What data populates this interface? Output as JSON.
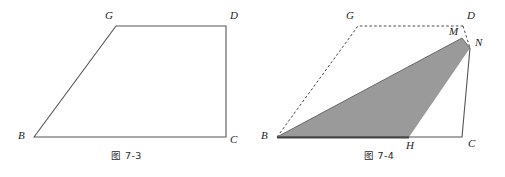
{
  "page": {
    "background_color": "#ffffff",
    "width": 505,
    "height": 177
  },
  "style": {
    "stroke_color": "#555555",
    "dash_color": "#4a4a4a",
    "fill_gray": "#9a9a9a",
    "label_color": "#1d1d1d"
  },
  "figures": [
    {
      "id": "figure-7-3",
      "caption": "图 7-3",
      "description": "trapezoid BGDC",
      "labels": {
        "G": "G",
        "D": "D",
        "B": "B",
        "C": "C"
      },
      "vertices": {
        "G": {
          "x": 116,
          "y": 26
        },
        "D": {
          "x": 226,
          "y": 26
        },
        "B": {
          "x": 34,
          "y": 137
        },
        "C": {
          "x": 226,
          "y": 137
        }
      },
      "label_positions": {
        "G": {
          "x": 105,
          "y": 10
        },
        "D": {
          "x": 230,
          "y": 10
        },
        "B": {
          "x": 18,
          "y": 130
        },
        "C": {
          "x": 230,
          "y": 134
        }
      },
      "edges": [
        {
          "from": "B",
          "to": "G",
          "style": "solid"
        },
        {
          "from": "G",
          "to": "D",
          "style": "solid"
        },
        {
          "from": "D",
          "to": "C",
          "style": "solid"
        },
        {
          "from": "C",
          "to": "B",
          "style": "solid"
        }
      ]
    },
    {
      "id": "figure-7-4",
      "caption": "图 7-4",
      "description": "trapezoid BGDC with shaded triangle B-M-H and point N",
      "labels": {
        "G": "G",
        "D": "D",
        "M": "M",
        "N": "N",
        "B": "B",
        "H": "H",
        "C": "C"
      },
      "vertices": {
        "G": {
          "x": 105,
          "y": 26
        },
        "D": {
          "x": 210,
          "y": 26
        },
        "M": {
          "x": 209,
          "y": 38
        },
        "N": {
          "x": 217,
          "y": 48
        },
        "B": {
          "x": 24,
          "y": 137
        },
        "H": {
          "x": 156,
          "y": 137
        },
        "C": {
          "x": 209,
          "y": 137
        }
      },
      "label_positions": {
        "G": {
          "x": 93,
          "y": 10
        },
        "D": {
          "x": 214,
          "y": 10
        },
        "M": {
          "x": 196,
          "y": 26
        },
        "N": {
          "x": 222,
          "y": 37
        },
        "B": {
          "x": 8,
          "y": 130
        },
        "H": {
          "x": 153,
          "y": 136
        },
        "C": {
          "x": 215,
          "y": 134
        }
      },
      "edges": [
        {
          "from": "B",
          "to": "G",
          "style": "dashed"
        },
        {
          "from": "G",
          "to": "D",
          "style": "dashed"
        },
        {
          "from": "D",
          "to": "N",
          "style": "dashed"
        },
        {
          "from": "N",
          "to": "C",
          "style": "solid"
        },
        {
          "from": "C",
          "to": "B",
          "style": "solid"
        },
        {
          "from": "B",
          "to": "M",
          "style": "solid"
        },
        {
          "from": "M",
          "to": "N",
          "style": "solid"
        }
      ],
      "shaded_region": {
        "name": "triangle-bmh",
        "points": "24,137 209,38 217,48 156,137",
        "fill": "#9a9a9a"
      }
    }
  ]
}
